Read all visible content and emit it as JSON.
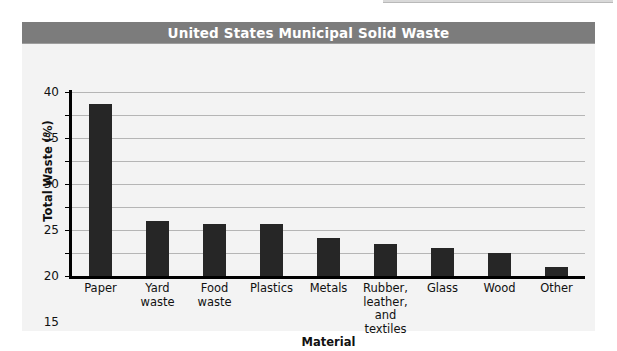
{
  "figure": {
    "title": "United States Municipal Solid Waste",
    "title_bar_color": "#7c7c7c",
    "panel_color": "#f3f3f3",
    "bar_color": "#262626",
    "gridline_color": "#b5b5b5",
    "axis_color": "#000000"
  },
  "chart_data": {
    "type": "bar",
    "title": "United States Municipal Solid Waste",
    "xlabel": "Material",
    "ylabel": "Total Waste (%)",
    "ylim": [
      0,
      40
    ],
    "ytick_step": 5,
    "yticks": [
      0,
      5,
      10,
      15,
      20,
      25,
      30,
      35,
      40
    ],
    "ytick_labels": [
      "0",
      "5",
      "10",
      "15",
      "20",
      "25",
      "30",
      "35",
      "40"
    ],
    "grid": true,
    "legend": null,
    "categories": [
      "Paper",
      "Yard waste",
      "Food waste",
      "Plastics",
      "Metals",
      "Rubber, leather, and textiles",
      "Glass",
      "Wood",
      "Other"
    ],
    "category_lines": [
      [
        "Paper"
      ],
      [
        "Yard",
        "waste"
      ],
      [
        "Food",
        "waste"
      ],
      [
        "Plastics"
      ],
      [
        "Metals"
      ],
      [
        "Rubber,",
        "leather,",
        "and textiles"
      ],
      [
        "Glass"
      ],
      [
        "Wood"
      ],
      [
        "Other"
      ]
    ],
    "values": [
      37.5,
      12,
      11.3,
      11.3,
      8.2,
      7,
      6,
      5,
      2
    ]
  }
}
